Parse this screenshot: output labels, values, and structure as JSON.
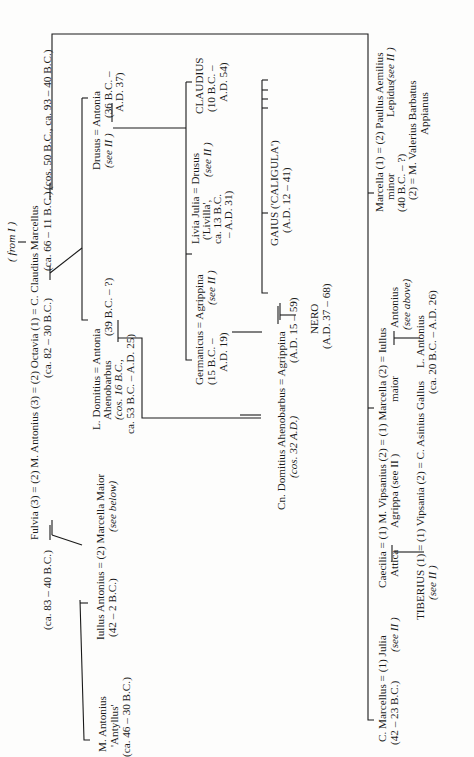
{
  "diagram": {
    "type": "genealogical-stemma",
    "orientation": "rotated-90-ccw",
    "header": {
      "from_ref": "( from I )"
    },
    "generation1": {
      "line1": "Fulvia (3) = (2) M. Antonius (3) = (2) Octavia (1) = C. Claudius Marcellus",
      "line2_fulvia": "(ca. 83 – 40 B.C.)",
      "line2_antonius": "(ca. 82 – 30 B.C.)",
      "line2_octavia": "(ca. 66 – 11 B.C.)",
      "line2_marcellus": "(cos. 50 B.C., ca. 93 – 40 B.C.)"
    },
    "fulvia_children": {
      "antyllus": {
        "name": "M. Antonius",
        "nickname": "'Antyllus'",
        "dates": "(ca. 46 – 30 B.C.)"
      },
      "iullus": {
        "line1": "Iullus Antonius = (2) Marcella Maior",
        "line2_dates": "(42 – 2 B.C.)",
        "line2_note": "(see below)"
      }
    },
    "antonia_children": {
      "domitius": {
        "line1": "L. Domitius = Antonia",
        "line2": "Ahenobarbus",
        "line2_antonia": "(39 B.C. – ?)",
        "line3": "(cos. 16 B.C.,",
        "line4": "ca. 53 B.C. – A.D. 25)"
      },
      "drusus": {
        "line1": "Drusus = Antonia",
        "line2_note": "(see II )",
        "line2_dates": "(36 B.C. –",
        "line3": "A.D. 37)"
      }
    },
    "drusus_children": {
      "germanicus": {
        "line1": "Germanicus = Agrippina",
        "line2": "(15 B.C. –",
        "line2_note": "(see II )",
        "line3": "A.D. 19)"
      },
      "livilla": {
        "line1": "Livia Julia = Drusus",
        "line2": "('Livilla',",
        "line2_note": "(see II )",
        "line3": "ca. 13 B.C.",
        "line4": "– A.D. 31)"
      },
      "claudius": {
        "line1": "CLAUDIUS",
        "line2": "(10 B.C. –",
        "line3": "A.D. 54)"
      }
    },
    "germanicus_children": {
      "gaius": {
        "line1": "GAIUS ('CALIGULA')",
        "line2": "(A.D. 12 – 41)"
      }
    },
    "domitius_children": {
      "cn_domitius": {
        "line1": "Cn. Domitius Ahenobarbus = Agrippina",
        "line2": "(cos. 32 A.D.)",
        "line2_agrippina": "(A.D. 15 – 59)"
      },
      "nero": {
        "line1": "NERO",
        "line2": "(A.D. 37 – 68)"
      }
    },
    "octavia_children": {
      "marcellus": {
        "line1": "C. Marcellus = (1) Julia",
        "line2": "(42 – 23 B.C.)",
        "line2_note": "(see II )"
      },
      "agrippa": {
        "line1": "Caecilia = (1) M. Vipsanius (2) = (1) Marcella (2) = Iullus",
        "line2a": "Attica",
        "line2b": "Agrippa (see II )",
        "line2c": "maior",
        "line2d": "Antonius",
        "line3": "(see above)"
      },
      "tiberius": {
        "line1": "TIBERIUS (1) = (1) Vipsania (2) = C. Asinius Gallus",
        "line2": "(see II )"
      },
      "l_antonius": {
        "line1": "L. Antonius",
        "line2": "(ca. 20 B.C. – A.D. 26)"
      },
      "marcella_minor": {
        "line1": "Marcella (1) = (2) Paullus Aemilius",
        "line2a": "minor",
        "line2b": "Lepidus",
        "line2_note": "(see II )",
        "line3": "(40 B.C. – ?)",
        "line4": "(2) = M. Valerius Barbatus",
        "line5": "Appianus"
      }
    }
  }
}
